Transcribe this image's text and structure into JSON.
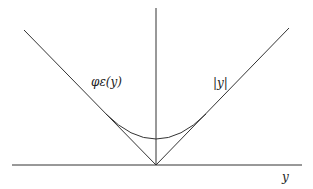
{
  "diagram": {
    "labels": {
      "phi": "φε(y)",
      "abs": "|y|",
      "axis_x": "y"
    },
    "stroke_color": "#333333"
  }
}
